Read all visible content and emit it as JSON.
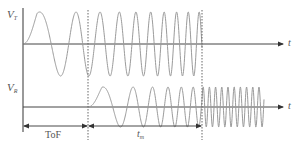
{
  "diagram": {
    "colors": {
      "axis": "#555555",
      "wave": "#9a9a9a",
      "dashed": "#666666",
      "text": "#555555"
    },
    "signals": [
      {
        "id": "transmitted",
        "label_main": "V",
        "label_sub": "T",
        "axis_label": "t",
        "baseline_y": 44,
        "amplitude": 32,
        "start_x": 23,
        "end_x": 202,
        "description": "Chirp signal with increasing frequency, starts at origin"
      },
      {
        "id": "received",
        "label_main": "V",
        "label_sub": "R",
        "axis_label": "t",
        "baseline_y": 107,
        "amplitude": 20,
        "start_x": 88,
        "end_x": 264,
        "description": "Delayed echo of chirp, followed by constant high-frequency tail"
      }
    ],
    "markers": [
      {
        "id": "tof-end",
        "x": 88,
        "style": "dashed"
      },
      {
        "id": "tm-end",
        "x": 202,
        "style": "dashed"
      }
    ],
    "intervals": [
      {
        "id": "tof",
        "label": "ToF",
        "italic": false,
        "from_x": 23,
        "to_x": 88
      },
      {
        "id": "tm",
        "label_main": "t",
        "label_sub": "m",
        "italic": true,
        "from_x": 88,
        "to_x": 202
      }
    ]
  }
}
